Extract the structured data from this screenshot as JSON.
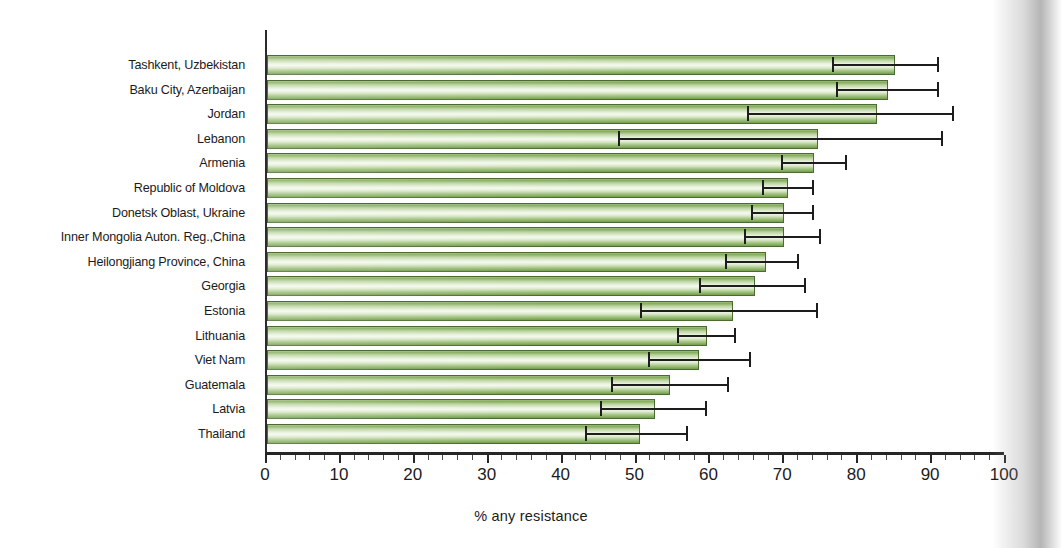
{
  "chart_data": {
    "type": "bar",
    "orientation": "horizontal",
    "title": "",
    "xlabel": "% any resistance",
    "ylabel": "",
    "xlim": [
      0,
      100
    ],
    "xticks": [
      0,
      10,
      20,
      30,
      40,
      50,
      60,
      70,
      80,
      90,
      100
    ],
    "grid": false,
    "legend": null,
    "series_name": "% any resistance",
    "bar_color": "#8fb463",
    "bar_border_color": "#4b6b33",
    "error_bar_color": "#1d1d1d",
    "categories": [
      "Tashkent, Uzbekistan",
      "Baku City, Azerbaijan",
      "Jordan",
      "Lebanon",
      "Armenia",
      "Republic of Moldova",
      "Donetsk Oblast, Ukraine",
      "Inner Mongolia Auton. Reg.,China",
      "Heilongjiang Province, China",
      "Georgia",
      "Estonia",
      "Lithuania",
      "Viet Nam",
      "Guatemala",
      "Latvia",
      "Thailand"
    ],
    "values": [
      85.0,
      84.0,
      82.5,
      74.5,
      74.0,
      70.5,
      70.0,
      70.0,
      67.5,
      66.0,
      63.0,
      59.5,
      58.5,
      54.5,
      52.5,
      50.5
    ],
    "ci_low": [
      76.5,
      77.0,
      65.0,
      47.5,
      69.5,
      67.0,
      65.5,
      64.5,
      62.0,
      58.5,
      50.5,
      55.5,
      51.5,
      46.5,
      45.0,
      43.0
    ],
    "ci_high": [
      91.0,
      91.0,
      93.0,
      91.5,
      78.5,
      74.0,
      74.0,
      75.0,
      72.0,
      73.0,
      74.5,
      63.5,
      65.5,
      62.5,
      59.5,
      57.0
    ]
  },
  "axis": {
    "x_title": "% any resistance",
    "tick_labels": [
      "0",
      "10",
      "20",
      "30",
      "40",
      "50",
      "60",
      "70",
      "80",
      "90",
      "100"
    ]
  }
}
